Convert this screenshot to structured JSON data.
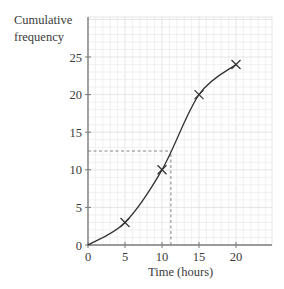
{
  "chart_data": {
    "type": "line",
    "title": "",
    "xlabel": "Time (hours)",
    "ylabel": "Cumulative frequency",
    "ylabel_lines": [
      "Cumulative",
      "frequency"
    ],
    "x": [
      0,
      5,
      10,
      15,
      20
    ],
    "series": [
      {
        "name": "Cumulative frequency curve",
        "values": [
          0,
          3,
          10,
          20,
          24
        ],
        "marked_points": [
          [
            5,
            3
          ],
          [
            10,
            10
          ],
          [
            15,
            20
          ],
          [
            20,
            24
          ]
        ],
        "marker": "cross"
      }
    ],
    "xlim": [
      0,
      25
    ],
    "ylim": [
      0,
      27.5
    ],
    "x_ticks": [
      "0",
      "5",
      "10",
      "15",
      "20"
    ],
    "y_ticks": [
      "0",
      "5",
      "10",
      "15",
      "20",
      "25"
    ],
    "grid": true,
    "annotations": [
      {
        "type": "dashed-horizontal",
        "y": 12.5,
        "x_from": 0,
        "x_to": 11.2
      },
      {
        "type": "dashed-vertical",
        "x": 11.2,
        "y_from": 0,
        "y_to": 12.5
      }
    ]
  },
  "colors": {
    "axis": "#7a7a7a",
    "curve": "#333333",
    "grid_minor": "#ececec",
    "grid_major": "#dedede",
    "dashed": "#777777"
  }
}
